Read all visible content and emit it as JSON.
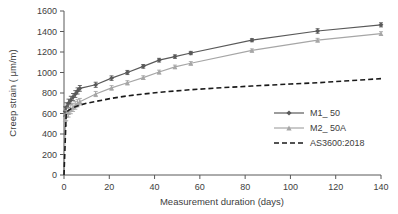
{
  "chart_data": {
    "type": "line",
    "title": "",
    "xlabel": "Measurement duration (days)",
    "ylabel": "Creep strain ( μm/m)",
    "xlim": [
      0,
      140
    ],
    "ylim": [
      0,
      1600
    ],
    "xticks": [
      0,
      20,
      40,
      60,
      80,
      100,
      120,
      140
    ],
    "yticks": [
      0,
      200,
      400,
      600,
      800,
      1000,
      1200,
      1400,
      1600
    ],
    "grid": false,
    "legend_position": "center-right",
    "series": [
      {
        "name": "M1_ 50",
        "color": "#595959",
        "marker": "diamond",
        "linestyle": "solid",
        "x": [
          0,
          0.5,
          1,
          2,
          3,
          4,
          5,
          6,
          7,
          14,
          21,
          28,
          35,
          42,
          49,
          56,
          83,
          112,
          140
        ],
        "y": [
          0,
          620,
          660,
          700,
          730,
          760,
          790,
          820,
          845,
          880,
          945,
          1000,
          1060,
          1120,
          1155,
          1190,
          1315,
          1405,
          1465
        ],
        "yerr": [
          0,
          45,
          45,
          40,
          38,
          35,
          33,
          30,
          28,
          25,
          22,
          20,
          18,
          18,
          17,
          16,
          15,
          22,
          20
        ]
      },
      {
        "name": "M2_ 50A",
        "color": "#a6a6a6",
        "marker": "triangle",
        "linestyle": "solid",
        "x": [
          0,
          0.5,
          1,
          2,
          3,
          4,
          5,
          6,
          7,
          14,
          21,
          28,
          35,
          42,
          49,
          56,
          83,
          112,
          140
        ],
        "y": [
          0,
          540,
          580,
          610,
          640,
          660,
          680,
          700,
          715,
          790,
          850,
          900,
          950,
          1005,
          1055,
          1090,
          1215,
          1315,
          1380
        ],
        "yerr": [
          0,
          55,
          50,
          45,
          42,
          40,
          38,
          35,
          32,
          25,
          22,
          20,
          18,
          18,
          17,
          16,
          15,
          18,
          18
        ]
      },
      {
        "name": "AS3600:2018",
        "color": "#1a1a1a",
        "marker": "none",
        "linestyle": "dashed",
        "x": [
          0,
          1,
          2,
          3,
          5,
          7,
          10,
          14,
          21,
          28,
          35,
          42,
          49,
          56,
          70,
          83,
          100,
          112,
          126,
          140
        ],
        "y": [
          0,
          610,
          630,
          645,
          665,
          682,
          700,
          718,
          748,
          772,
          790,
          806,
          820,
          832,
          852,
          868,
          888,
          900,
          920,
          940
        ],
        "yerr": []
      }
    ]
  },
  "legend": {
    "items": [
      {
        "label": "M1_ 50"
      },
      {
        "label": "M2_ 50A"
      },
      {
        "label": "AS3600:2018"
      }
    ]
  },
  "axes": {
    "x_title": "Measurement duration (days)",
    "y_title": "Creep strain ( μm/m)",
    "x_tick_labels": [
      "0",
      "20",
      "40",
      "60",
      "80",
      "100",
      "120",
      "140"
    ],
    "y_tick_labels": [
      "0",
      "200",
      "400",
      "600",
      "800",
      "1000",
      "1200",
      "1400",
      "1600"
    ]
  },
  "colors": {
    "series_m1": "#595959",
    "series_m2": "#a6a6a6",
    "series_code": "#1a1a1a",
    "axis": "#595959",
    "text": "#404040",
    "background": "#ffffff"
  }
}
